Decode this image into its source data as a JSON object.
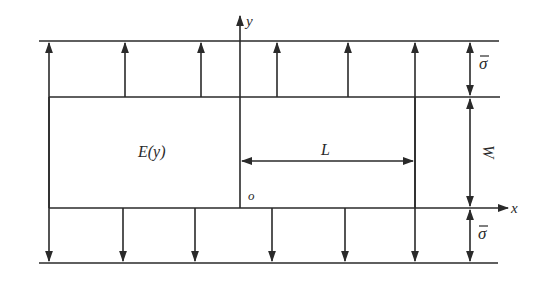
{
  "diagram": {
    "labels": {
      "y_axis": "y",
      "x_axis": "x",
      "origin": "o",
      "modulus": "E(y)",
      "length": "L",
      "width": "W",
      "stress_top": "σ",
      "stress_bottom": "σ"
    },
    "colors": {
      "line": "#2a2a2a",
      "background": "#ffffff"
    },
    "top_arrows_x": [
      49,
      125,
      201,
      277,
      348,
      415
    ],
    "bottom_arrows_x": [
      49,
      123,
      195,
      272,
      345,
      415
    ]
  }
}
